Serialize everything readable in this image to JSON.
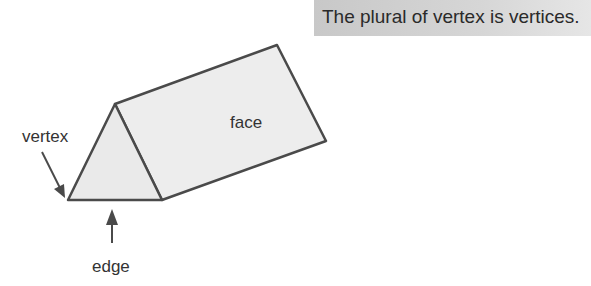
{
  "banner": {
    "text": "The plural of vertex is vertices."
  },
  "diagram": {
    "labels": {
      "vertex": "vertex",
      "face": "face",
      "edge": "edge"
    },
    "colors": {
      "stroke": "#4a4a4a",
      "fill": "#ececec"
    }
  }
}
